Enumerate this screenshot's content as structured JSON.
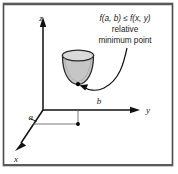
{
  "figure": {
    "frame": {
      "border_color": "#4a4a4a",
      "background": "#ffffff"
    },
    "axes": {
      "z_label": "z",
      "y_label": "y",
      "x_label": "x",
      "color": "#111111"
    },
    "marks": {
      "a_label": "a",
      "b_label": "b",
      "point_color": "#000000"
    },
    "annotation": {
      "line1": "f(a, b) ≤ f(x, y)",
      "line1_parts": {
        "f1": "f",
        "args1": "(a, b)",
        "relation": " ≤ ",
        "f2": "f",
        "args2": "(x, y)"
      },
      "line2": "relative",
      "line3": "minimum point",
      "arrow_name": "curved-callout-arrow"
    },
    "surface": {
      "name": "paraboloid-bowl",
      "fill": "#c8c8c8",
      "rim_fill": "#d9d9d9",
      "stroke": "#2b2b2b"
    }
  }
}
